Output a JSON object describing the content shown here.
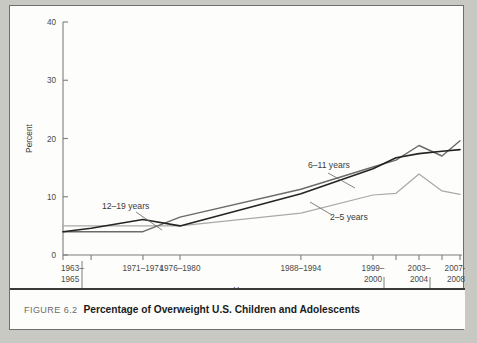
{
  "figure": {
    "number_label": "FIGURE 6.2",
    "caption": "Percentage of Overweight U.S. Children and Adolescents"
  },
  "chart_data": {
    "type": "line",
    "title": "Percentage of Overweight U.S. Children and Adolescents",
    "xlabel": "Year",
    "ylabel": "Percent",
    "ylim": [
      0,
      40
    ],
    "yticks": [
      0,
      10,
      20,
      30,
      40
    ],
    "ytick_labels": [
      "0",
      "10",
      "20",
      "30",
      "40"
    ],
    "grid": false,
    "legend": "inline-annotations",
    "categories": [
      "1963–1965",
      "1966–1970",
      "1971–1974",
      "1976–1980",
      "1988–1994",
      "1999–2000",
      "2001–2002",
      "2003–2004",
      "2005–2006",
      "2007–2008"
    ],
    "category_rows": [
      {
        "label": "1963–1965",
        "row": 0
      },
      {
        "label": "1966–1970",
        "row": 1
      },
      {
        "label": "1971–1974",
        "row": 0
      },
      {
        "label": "1976–1980",
        "row": 0
      },
      {
        "label": "1988–1994",
        "row": 0
      },
      {
        "label": "1999–2000",
        "row": 0
      },
      {
        "label": "2001–2002",
        "row": 1
      },
      {
        "label": "2003–2004",
        "row": 0
      },
      {
        "label": "2005–2006",
        "row": 1
      },
      {
        "label": "2007–2008",
        "row": 0
      }
    ],
    "series": [
      {
        "name": "2–5 years",
        "color": "#a9a9a9",
        "width": 1.25,
        "values": [
          5.0,
          5.0,
          5.0,
          5.0,
          7.2,
          10.3,
          10.6,
          13.9,
          11.0,
          10.4
        ],
        "annotation": {
          "text": "2–5 years",
          "x": 320,
          "y": 214
        }
      },
      {
        "name": "6–11 years",
        "color": "#6b6b6b",
        "width": 1.45,
        "values": [
          4.0,
          4.0,
          4.0,
          6.5,
          11.3,
          15.1,
          16.3,
          18.8,
          17.0,
          19.6
        ],
        "annotation": {
          "text": "6–11 years",
          "x": 298,
          "y": 162
        }
      },
      {
        "name": "12–19 years",
        "color": "#242424",
        "width": 1.6,
        "values": [
          4.0,
          4.6,
          6.1,
          5.0,
          10.5,
          14.8,
          16.7,
          17.4,
          17.8,
          18.1
        ],
        "annotation": {
          "text": "12–19 years",
          "x": 92,
          "y": 203
        }
      }
    ]
  },
  "axes": {
    "y_axis_title": "Percent",
    "x_axis_title": "Year"
  }
}
